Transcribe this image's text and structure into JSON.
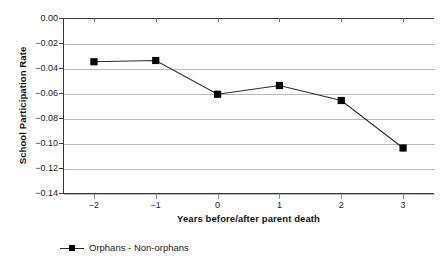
{
  "chart_data": {
    "type": "line",
    "title": "",
    "subtitle": "",
    "xlabel": "Years before/after parent death",
    "ylabel": "School Participation Rate",
    "x": [
      -2,
      -1,
      0,
      1,
      2,
      3
    ],
    "categories": [
      "-2",
      "-1",
      "0",
      "1",
      "2",
      "3"
    ],
    "series": [
      {
        "name": "Orphans - Non-orphans",
        "values": [
          -0.035,
          -0.034,
          -0.061,
          -0.054,
          -0.066,
          -0.104
        ],
        "marker": "square",
        "marker_color": "#000000",
        "line_color": "#2b2b2b"
      }
    ],
    "ylim": [
      -0.14,
      0.0
    ],
    "xlim": [
      -2.5,
      3.5
    ],
    "y_ticks": [
      0.0,
      -0.02,
      -0.04,
      -0.06,
      -0.08,
      -0.1,
      -0.12,
      -0.14
    ],
    "y_tick_labels": [
      "0.00",
      "-0.02",
      "-0.04",
      "-0.06",
      "-0.08",
      "-0.10",
      "-0.12",
      "-0.14"
    ],
    "x_ticks": [
      -2,
      -1,
      0,
      1,
      2,
      3
    ],
    "x_tick_labels": [
      "-2",
      "-1",
      "0",
      "1",
      "2",
      "3"
    ],
    "grid": true,
    "grid_axis": "y",
    "grid_color": "#b9b9b9",
    "legend_position": "bottom-left",
    "background_color": "#ffffff",
    "axis_color": "#3a3a3a"
  },
  "legend": {
    "entries": [
      {
        "label": "Orphans - Non-orphans",
        "symbol": "line-with-square-marker"
      }
    ]
  },
  "axes": {
    "y_title": "School Participation Rate",
    "x_title": "Years before/after parent death"
  }
}
